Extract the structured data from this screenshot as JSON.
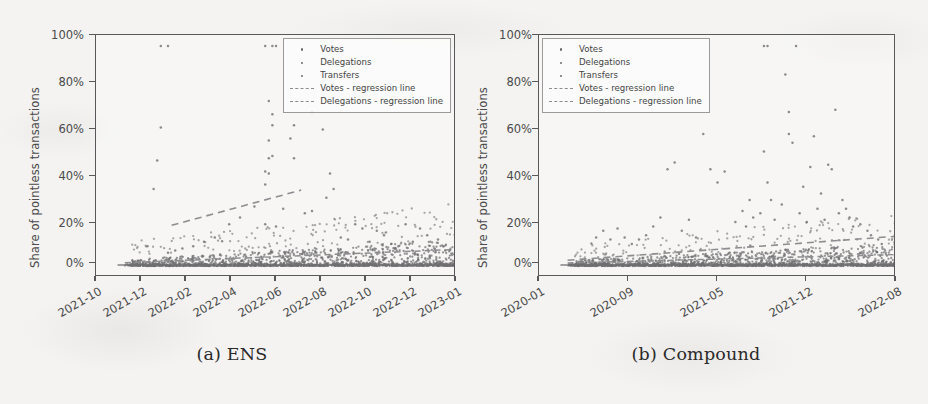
{
  "figure": {
    "background_color": "#f4f3f1",
    "axis_color": "#58585a",
    "marker_color": "#6f6f72",
    "regression_color": "#8d8d90"
  },
  "panels": [
    {
      "id": "ens",
      "caption": "(a) ENS",
      "chart_data": {
        "type": "scatter",
        "title": "",
        "xlabel": "",
        "ylabel": "Share of pointless transactions",
        "ylim": [
          -5,
          105
        ],
        "yticks": [
          "0%",
          "20%",
          "40%",
          "60%",
          "80%",
          "100%"
        ],
        "ytick_values": [
          0,
          20,
          40,
          60,
          80,
          100
        ],
        "xticks": [
          "2021-10",
          "2021-12",
          "2022-02",
          "2022-04",
          "2022-06",
          "2022-08",
          "2022-10",
          "2022-12",
          "2023-01"
        ],
        "xlim": [
          "2021-09-15",
          "2023-01-20"
        ],
        "grid": false,
        "legend_position": "upper right",
        "legend": [
          {
            "label": "Votes",
            "marker": "dot"
          },
          {
            "label": "Delegations",
            "marker": "dot"
          },
          {
            "label": "Transfers",
            "marker": "dot"
          },
          {
            "label": "Votes - regression line",
            "marker": "dashed-line"
          },
          {
            "label": "Delegations - regression line",
            "marker": "dashed-line"
          }
        ],
        "series": [
          {
            "name": "Votes",
            "note": "sparse high-variance points; several at 100% near 2022-01 and 2022-05",
            "points": [
              [
                18,
                100
              ],
              [
                20,
                100
              ],
              [
                47,
                100
              ],
              [
                49,
                100
              ],
              [
                50,
                100
              ],
              [
                18,
                63
              ],
              [
                48,
                75
              ],
              [
                49,
                69
              ],
              [
                49,
                64
              ],
              [
                48,
                57
              ],
              [
                49,
                50
              ],
              [
                48,
                49
              ],
              [
                47,
                43
              ],
              [
                48,
                42
              ],
              [
                47,
                37
              ],
              [
                55,
                64
              ],
              [
                54,
                58
              ],
              [
                55,
                49
              ],
              [
                60,
                70
              ],
              [
                63,
                62
              ],
              [
                65,
                42
              ],
              [
                17,
                48
              ],
              [
                16,
                35
              ],
              [
                66,
                35
              ],
              [
                64,
                31
              ],
              [
                52,
                26
              ],
              [
                58,
                24
              ],
              [
                60,
                25
              ],
              [
                44,
                27
              ],
              [
                40,
                22
              ],
              [
                37,
                19
              ],
              [
                47,
                19
              ],
              [
                50,
                18
              ],
              [
                72,
                19
              ],
              [
                74,
                17
              ],
              [
                78,
                16
              ],
              [
                80,
                14
              ],
              [
                86,
                19
              ],
              [
                90,
                17
              ],
              [
                92,
                14
              ],
              [
                95,
                12
              ],
              [
                33,
                13
              ],
              [
                30,
                11
              ],
              [
                27,
                9
              ],
              [
                24,
                8
              ],
              [
                22,
                7
              ],
              [
                20,
                6
              ],
              [
                68,
                13
              ],
              [
                70,
                12
              ],
              [
                76,
                11
              ],
              [
                82,
                10
              ],
              [
                84,
                9
              ],
              [
                88,
                11
              ],
              [
                94,
                8
              ],
              [
                97,
                7
              ]
            ]
          },
          {
            "name": "Delegations",
            "note": "dense band from 0% to ~12% rising slowly across time",
            "band": {
              "start_x": 10,
              "end_x": 100,
              "low": 0,
              "high": 12
            }
          },
          {
            "name": "Transfers",
            "note": "dense flat band at ~0%",
            "band": {
              "start_x": 8,
              "end_x": 100,
              "low": 0,
              "high": 1.2
            }
          }
        ],
        "regression_lines": [
          {
            "name": "Votes - regression line",
            "x0": 21,
            "y0": 18.5,
            "x1": 57,
            "y1": 34.5
          },
          {
            "name": "Delegations - regression line",
            "x0": 8,
            "y0": 1.5,
            "x1": 100,
            "y1": 7.5
          }
        ]
      }
    },
    {
      "id": "compound",
      "caption": "(b) Compound",
      "chart_data": {
        "type": "scatter",
        "title": "",
        "xlabel": "",
        "ylabel": "Share of pointless transactions",
        "ylim": [
          -5,
          105
        ],
        "yticks": [
          "0%",
          "20%",
          "40%",
          "60%",
          "80%",
          "100%"
        ],
        "ytick_values": [
          0,
          20,
          40,
          60,
          80,
          100
        ],
        "xticks": [
          "2020-01",
          "2020-09",
          "2021-05",
          "2021-12",
          "2022-08"
        ],
        "xlim": [
          "2019-12-01",
          "2023-01-15"
        ],
        "grid": false,
        "legend_position": "upper left",
        "legend": [
          {
            "label": "Votes",
            "marker": "dot"
          },
          {
            "label": "Delegations",
            "marker": "dot"
          },
          {
            "label": "Transfers",
            "marker": "dot"
          },
          {
            "label": "Votes - regression line",
            "marker": "dashed-line"
          },
          {
            "label": "Delegations - regression line",
            "marker": "dashed-line"
          }
        ],
        "series": [
          {
            "name": "Votes",
            "note": "scatter broadening over time, two points at 100% near 2022-02 and 2022-05",
            "points": [
              [
                63,
                100
              ],
              [
                64,
                100
              ],
              [
                72,
                100
              ],
              [
                46,
                60
              ],
              [
                48,
                44
              ],
              [
                50,
                38
              ],
              [
                52,
                43
              ],
              [
                55,
                20
              ],
              [
                57,
                25
              ],
              [
                58,
                18
              ],
              [
                59,
                30
              ],
              [
                60,
                22
              ],
              [
                62,
                24
              ],
              [
                63,
                52
              ],
              [
                64,
                38
              ],
              [
                65,
                30
              ],
              [
                66,
                21
              ],
              [
                68,
                28
              ],
              [
                69,
                87
              ],
              [
                70,
                70
              ],
              [
                70,
                60
              ],
              [
                71,
                56
              ],
              [
                73,
                24
              ],
              [
                74,
                36
              ],
              [
                75,
                20
              ],
              [
                76,
                45
              ],
              [
                77,
                59
              ],
              [
                78,
                26
              ],
              [
                79,
                33
              ],
              [
                80,
                21
              ],
              [
                81,
                46
              ],
              [
                82,
                44
              ],
              [
                83,
                71
              ],
              [
                84,
                24
              ],
              [
                85,
                30
              ],
              [
                86,
                26
              ],
              [
                87,
                22
              ],
              [
                88,
                18
              ],
              [
                36,
                44
              ],
              [
                38,
                47
              ],
              [
                34,
                22
              ],
              [
                32,
                18
              ],
              [
                30,
                14
              ],
              [
                28,
                12
              ],
              [
                26,
                10
              ],
              [
                24,
                13
              ],
              [
                22,
                17
              ],
              [
                20,
                12
              ],
              [
                42,
                21
              ],
              [
                44,
                13
              ],
              [
                40,
                16
              ],
              [
                90,
                19
              ],
              [
                92,
                16
              ],
              [
                93,
                14
              ],
              [
                95,
                12
              ],
              [
                96,
                10
              ],
              [
                18,
                16
              ],
              [
                16,
                13
              ]
            ]
          },
          {
            "name": "Delegations",
            "note": "dense band 0%-10% growing across time",
            "band": {
              "start_x": 10,
              "end_x": 100,
              "low": 0,
              "high": 10
            }
          },
          {
            "name": "Transfers",
            "note": "dense flat band near 0%",
            "band": {
              "start_x": 8,
              "end_x": 100,
              "low": 0,
              "high": 1.2
            }
          }
        ],
        "regression_lines": [
          {
            "name": "Votes - regression line",
            "x0": 8,
            "y0": 2.6,
            "x1": 100,
            "y1": 13.5
          },
          {
            "name": "Delegations - regression line",
            "x0": 8,
            "y0": 1.4,
            "x1": 100,
            "y1": 5.2
          }
        ]
      }
    }
  ]
}
